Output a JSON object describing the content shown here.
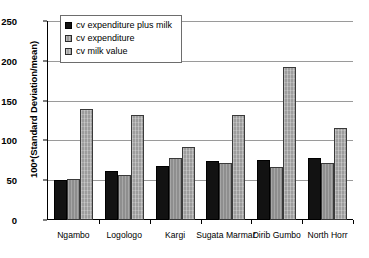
{
  "chart_data": {
    "type": "bar",
    "title": "",
    "xlabel": "",
    "ylabel": "100*(Standard Deviation/mean)",
    "ylim": [
      0,
      250
    ],
    "ytick_values": [
      0,
      50,
      100,
      150,
      200,
      250
    ],
    "ytick_labels": [
      "0",
      "50",
      "100",
      "150",
      "200",
      "250"
    ],
    "grid": true,
    "legend_position": "top-left",
    "categories": [
      "Ngambo",
      "Logologo",
      "Kargi",
      "Sugata Marmar",
      "Dirib Gumbo",
      "North Horr"
    ],
    "series": [
      {
        "name": "cv expenditure plus milk",
        "color": "#121212",
        "values": [
          50,
          62,
          68,
          74,
          75,
          78
        ]
      },
      {
        "name": "cv expenditure",
        "color": "#8e8e8e",
        "values": [
          52,
          57,
          78,
          71,
          66,
          72
        ]
      },
      {
        "name": "cv milk value",
        "color": "#9d9d9d",
        "values": [
          140,
          132,
          92,
          132,
          192,
          115
        ]
      }
    ]
  },
  "axis": {
    "y_title": "100*(Standard Deviation/mean)"
  },
  "legend": {
    "entries": [
      {
        "label": "cv expenditure plus milk"
      },
      {
        "label": "cv expenditure"
      },
      {
        "label": "cv milk value"
      }
    ]
  }
}
